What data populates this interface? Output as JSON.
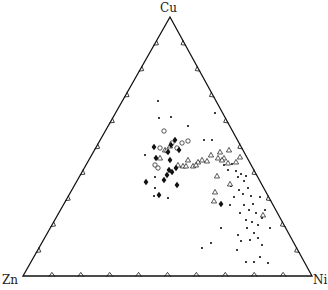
{
  "diagram": {
    "type": "ternary",
    "vertices": {
      "top": {
        "label": "Cu",
        "x": 170,
        "y": 17
      },
      "left": {
        "label": "Zn",
        "x": 23,
        "y": 276
      },
      "right": {
        "label": "Ni",
        "x": 312,
        "y": 276
      }
    },
    "tick_divisions": 10,
    "colors": {
      "line": "#111111",
      "point": "#111111"
    },
    "series": [
      {
        "name": "small-dots",
        "marker": "dot",
        "points": [
          [
            158,
            101
          ],
          [
            159,
            118
          ],
          [
            171,
            117
          ],
          [
            188,
            126
          ],
          [
            204,
            140
          ],
          [
            212,
            140
          ],
          [
            215,
            113
          ],
          [
            145,
            155
          ],
          [
            219,
            153
          ],
          [
            224,
            165
          ],
          [
            228,
            170
          ],
          [
            232,
            164
          ],
          [
            236,
            171
          ],
          [
            238,
            177
          ],
          [
            241,
            174
          ],
          [
            244,
            181
          ],
          [
            246,
            176
          ],
          [
            231,
            186
          ],
          [
            239,
            190
          ],
          [
            243,
            194
          ],
          [
            248,
            188
          ],
          [
            251,
            196
          ],
          [
            234,
            197
          ],
          [
            244,
            205
          ],
          [
            249,
            210
          ],
          [
            253,
            204
          ],
          [
            256,
            213
          ],
          [
            240,
            213
          ],
          [
            246,
            220
          ],
          [
            252,
            222
          ],
          [
            258,
            225
          ],
          [
            262,
            218
          ],
          [
            247,
            228
          ],
          [
            254,
            233
          ],
          [
            250,
            240
          ],
          [
            258,
            238
          ],
          [
            262,
            245
          ],
          [
            241,
            241
          ],
          [
            237,
            250
          ],
          [
            260,
            257
          ],
          [
            254,
            262
          ],
          [
            268,
            263
          ],
          [
            270,
            228
          ],
          [
            265,
            210
          ],
          [
            230,
            205
          ],
          [
            221,
            228
          ],
          [
            211,
            243
          ],
          [
            202,
            248
          ],
          [
            168,
            198
          ],
          [
            155,
            188
          ],
          [
            155,
            177
          ],
          [
            154,
            196
          ],
          [
            260,
            197
          ],
          [
            238,
            235
          ],
          [
            246,
            262
          ]
        ]
      },
      {
        "name": "open-triangles",
        "marker": "triangle",
        "points": [
          [
            178,
            165
          ],
          [
            183,
            166
          ],
          [
            188,
            160
          ],
          [
            193,
            166
          ],
          [
            198,
            162
          ],
          [
            202,
            160
          ],
          [
            207,
            161
          ],
          [
            211,
            155
          ],
          [
            218,
            158
          ],
          [
            224,
            158
          ],
          [
            229,
            150
          ],
          [
            236,
            162
          ],
          [
            240,
            157
          ],
          [
            220,
            152
          ],
          [
            222,
            160
          ],
          [
            228,
            163
          ],
          [
            215,
            192
          ],
          [
            230,
            184
          ],
          [
            214,
            201
          ],
          [
            263,
            215
          ],
          [
            160,
            158
          ],
          [
            165,
            150
          ],
          [
            170,
            146
          ],
          [
            196,
            165
          ],
          [
            186,
            166
          ],
          [
            217,
            176
          ]
        ]
      },
      {
        "name": "open-circles",
        "marker": "circle",
        "points": [
          [
            164,
            131
          ],
          [
            172,
            143
          ],
          [
            177,
            148
          ],
          [
            182,
            143
          ],
          [
            167,
            151
          ],
          [
            155,
            165
          ],
          [
            160,
            148
          ],
          [
            188,
            141
          ],
          [
            158,
            168
          ]
        ]
      },
      {
        "name": "filled-diamonds",
        "marker": "diamond",
        "points": [
          [
            154,
            147
          ],
          [
            168,
            152
          ],
          [
            170,
            160
          ],
          [
            175,
            140
          ],
          [
            179,
            150
          ],
          [
            176,
            168
          ],
          [
            169,
            170
          ],
          [
            167,
            175
          ],
          [
            164,
            180
          ],
          [
            172,
            172
          ],
          [
            146,
            182
          ],
          [
            159,
            195
          ],
          [
            177,
            185
          ],
          [
            221,
            204
          ],
          [
            156,
            158
          ],
          [
            171,
            145
          ]
        ]
      }
    ]
  }
}
